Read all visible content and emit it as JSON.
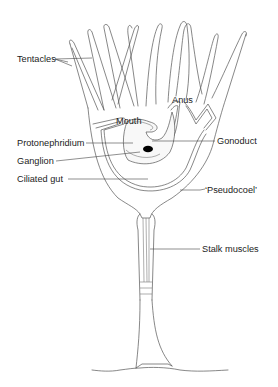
{
  "figure": {
    "labels": {
      "tentacles": "Tentacles",
      "anus": "Anus",
      "mouth": "Mouth",
      "protonephridium": "Protonephridium",
      "gonoduct": "Gonoduct",
      "ganglion": "Ganglion",
      "ciliated_gut": "Ciliated gut",
      "pseudocoel": "‘Pseudocoel’",
      "stalk_muscles": "Stalk muscles"
    },
    "colors": {
      "line": "#555555",
      "ganglion": "#000000",
      "background": "#ffffff"
    }
  }
}
